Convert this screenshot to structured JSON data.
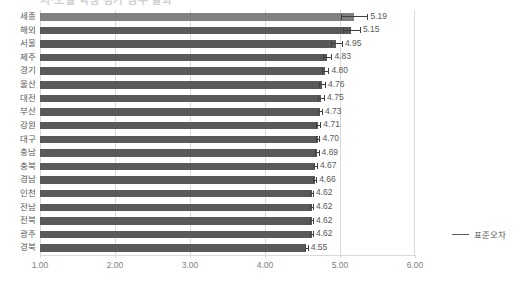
{
  "chart_data": {
    "type": "bar",
    "orientation": "horizontal",
    "title": "시·도별 학생 평가 점수 결과",
    "xlabel": "",
    "ylabel": "",
    "xlim": [
      1.0,
      6.0
    ],
    "xticks": [
      "1.00",
      "2.00",
      "3.00",
      "4.00",
      "5.00",
      "6.00"
    ],
    "xtick_values": [
      1.0,
      2.0,
      3.0,
      4.0,
      5.0,
      6.0
    ],
    "grid": true,
    "grid_axis": "x",
    "legend_position": "right",
    "categories": [
      "세종",
      "해외",
      "서울",
      "제주",
      "경기",
      "울산",
      "대전",
      "부산",
      "강원",
      "대구",
      "충남",
      "충북",
      "경남",
      "인천",
      "전남",
      "전북",
      "광주",
      "경북"
    ],
    "values": [
      5.19,
      5.15,
      4.95,
      4.83,
      4.8,
      4.76,
      4.75,
      4.73,
      4.71,
      4.7,
      4.69,
      4.67,
      4.66,
      4.62,
      4.62,
      4.62,
      4.62,
      4.55
    ],
    "data_labels": [
      "5.19",
      "5.15",
      "4.95",
      "4.83",
      "4.80",
      "4.76",
      "4.75",
      "4.73",
      "4.71",
      "4.70",
      "4.69",
      "4.67",
      "4.66",
      "4.62",
      "4.62",
      "4.62",
      "4.62",
      "4.55"
    ],
    "error_bars": [
      0.175,
      0.115,
      0.075,
      0.055,
      0.045,
      0.04,
      0.038,
      0.03,
      0.028,
      0.026,
      0.024,
      0.022,
      0.022,
      0.02,
      0.02,
      0.02,
      0.02,
      0.02
    ],
    "series": [
      {
        "name": "표준오차",
        "values": [
          5.19,
          5.15,
          4.95,
          4.83,
          4.8,
          4.76,
          4.75,
          4.73,
          4.71,
          4.7,
          4.69,
          4.67,
          4.66,
          4.62,
          4.62,
          4.62,
          4.62,
          4.55
        ]
      }
    ],
    "legend": [
      {
        "label": "표준오차",
        "marker": "line",
        "color": "#595959"
      }
    ],
    "colors": {
      "bar_default": "#595959",
      "bar_highlight": "#808080",
      "error_bar": "#404040",
      "gridline": "#d9d9d9",
      "text": "#595959",
      "tick_text": "#808080"
    },
    "highlight_index": 0
  },
  "legend": {
    "label": "표준오차"
  }
}
